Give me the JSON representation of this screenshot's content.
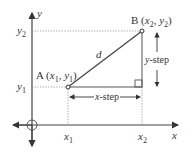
{
  "diagram": {
    "axes": {
      "x_label": "x",
      "y_label": "y"
    },
    "point_a": {
      "name": "A",
      "coords_label": "(x1, y1)",
      "x_tick": "x",
      "x_sub": "1",
      "y_tick": "y",
      "y_sub": "1"
    },
    "point_b": {
      "name": "B",
      "coords_label": "(x2, y2)",
      "x_tick": "x",
      "x_sub": "2",
      "y_tick": "y",
      "y_sub": "2"
    },
    "distance_label": "d",
    "x_step_label": "x-step",
    "y_step_label": "y-step",
    "colors": {
      "line": "#444444",
      "dotted": "#888888",
      "text": "#333333"
    }
  }
}
